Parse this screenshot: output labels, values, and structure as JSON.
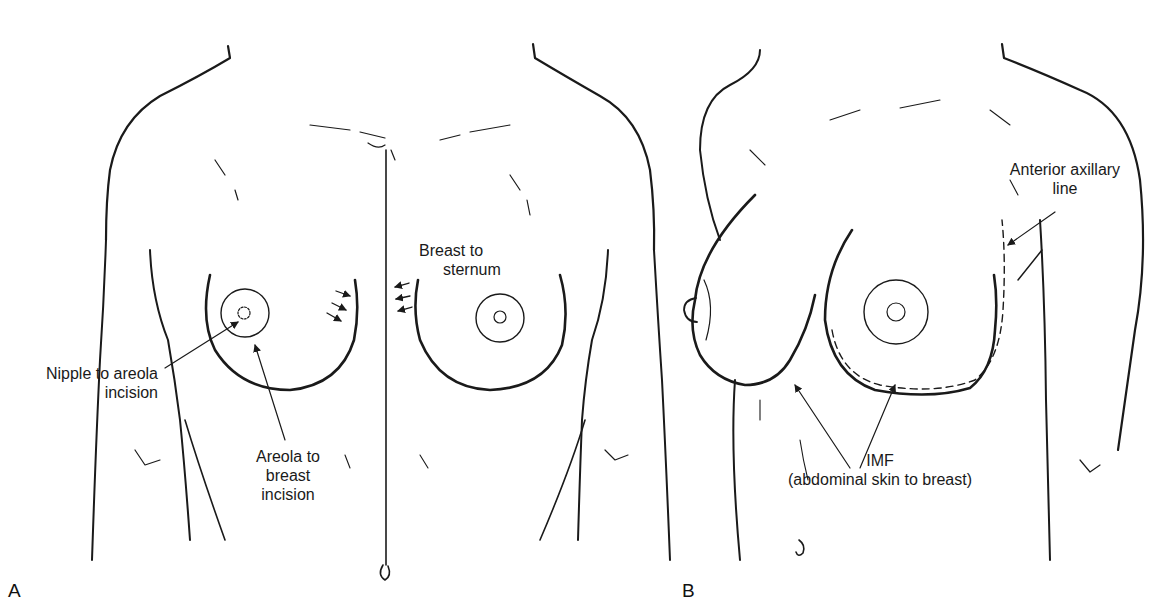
{
  "figure": {
    "panels": [
      {
        "letter": "A",
        "view": "frontal",
        "labels": {
          "breast_to_sternum": [
            "Breast to",
            "sternum"
          ],
          "nipple_to_areola": [
            "Nipple to areola",
            "incision"
          ],
          "areola_to_breast": [
            "Areola to",
            "breast",
            "incision"
          ]
        }
      },
      {
        "letter": "B",
        "view": "oblique",
        "labels": {
          "anterior_axillary": [
            "Anterior axillary",
            "line"
          ],
          "imf": [
            "IMF",
            "(abdominal skin to breast)"
          ]
        }
      }
    ],
    "line_color": "#1a1a1a"
  }
}
